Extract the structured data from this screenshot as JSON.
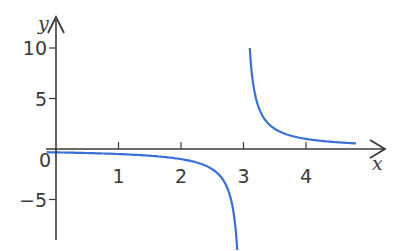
{
  "chart_data": {
    "type": "line",
    "title": "",
    "xlabel": "x",
    "ylabel": "y",
    "xlim": [
      -0.1,
      5.2
    ],
    "ylim": [
      -10,
      11
    ],
    "grid": false,
    "legend": null,
    "x_ticks": [
      0,
      1,
      2,
      3,
      4
    ],
    "x_tick_labels": [
      "0",
      "1",
      "2",
      "3",
      "4"
    ],
    "y_ticks": [
      10,
      5,
      -5
    ],
    "y_tick_labels": [
      "10",
      "5",
      "−5"
    ],
    "line_color": "#3a6fd8",
    "axis_color": "#3a3a3a",
    "series": [
      {
        "name": "y = 1/(x - 3), left branch",
        "x": [
          -0.15,
          0,
          0.5,
          1,
          1.5,
          2,
          2.3,
          2.5,
          2.7,
          2.8,
          2.85,
          2.9
        ],
        "y": [
          -0.32,
          -0.33,
          -0.4,
          -0.5,
          -0.67,
          -1,
          -1.43,
          -2,
          -3.33,
          -5,
          -6.67,
          -10
        ]
      },
      {
        "name": "y = 1/(x - 3), right branch",
        "x": [
          3.1,
          3.15,
          3.2,
          3.3,
          3.5,
          3.75,
          4,
          4.3,
          4.6,
          4.8
        ],
        "y": [
          10,
          6.67,
          5,
          3.33,
          2,
          1.33,
          1,
          0.77,
          0.63,
          0.56
        ]
      }
    ],
    "asymptote_x": 3
  }
}
